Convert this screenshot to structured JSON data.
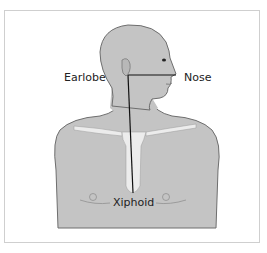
{
  "diagram": {
    "labels": {
      "earlobe": "Earlobe",
      "nose": "Nose",
      "xiphoid": "Xiphoid"
    },
    "colors": {
      "skin": "#c4c4c4",
      "outline": "#6e6e6e",
      "bone": "#ececec",
      "measure_line": "#111111",
      "frame": "#cfcfcf",
      "label_text": "#222222"
    },
    "points": {
      "earlobe": [
        128,
        75
      ],
      "nose": [
        176,
        75
      ],
      "xiphoid": [
        133,
        193
      ]
    }
  }
}
